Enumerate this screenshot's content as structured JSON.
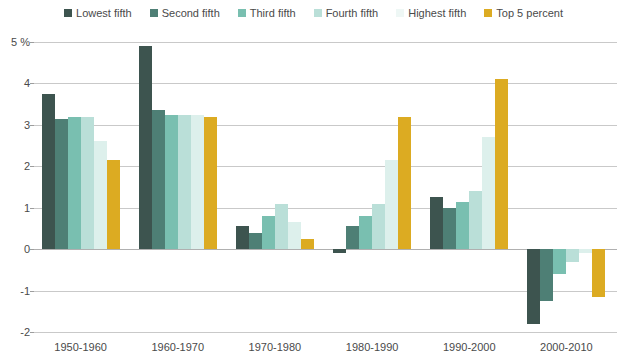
{
  "chart_data": {
    "type": "bar",
    "title": "",
    "subtitle": "",
    "xlabel": "",
    "ylabel": "",
    "ylim": [
      -2,
      5
    ],
    "yticks": [
      -2,
      -1,
      0,
      1,
      2,
      3,
      4,
      5
    ],
    "ytick_labels": [
      "-2",
      "-1",
      "0",
      "1",
      "2",
      "3",
      "4",
      "5 %"
    ],
    "grid": true,
    "legend_position": "top",
    "categories": [
      "1950-1960",
      "1960-1970",
      "1970-1980",
      "1980-1990",
      "1990-2000",
      "2000-2010"
    ],
    "series": [
      {
        "name": "Lowest fifth",
        "color": "#3d544f",
        "values": [
          3.75,
          4.9,
          0.55,
          -0.1,
          1.25,
          -1.8
        ]
      },
      {
        "name": "Second fifth",
        "color": "#4e7f75",
        "values": [
          3.15,
          3.35,
          0.38,
          0.55,
          1.0,
          -1.25
        ]
      },
      {
        "name": "Third fifth",
        "color": "#79bfb0",
        "values": [
          3.2,
          3.25,
          0.8,
          0.8,
          1.15,
          -0.6
        ]
      },
      {
        "name": "Fourth fifth",
        "color": "#badfd8",
        "values": [
          3.2,
          3.25,
          1.1,
          1.1,
          1.4,
          -0.3
        ]
      },
      {
        "name": "Highest fifth",
        "color": "#ddf0ec",
        "values": [
          2.6,
          3.25,
          0.65,
          2.15,
          2.7,
          -0.1
        ]
      },
      {
        "name": "Top 5 percent",
        "color": "#dcab22",
        "values": [
          2.15,
          3.2,
          0.25,
          3.2,
          4.1,
          -1.15
        ]
      }
    ]
  },
  "legend": {
    "items": [
      {
        "label": "Lowest fifth",
        "color": "#3d544f"
      },
      {
        "label": "Second fifth",
        "color": "#4e7f75"
      },
      {
        "label": "Third fifth",
        "color": "#79bfb0"
      },
      {
        "label": "Fourth fifth",
        "color": "#badfd8"
      },
      {
        "label": "Highest fifth",
        "color": "#eef7f5"
      },
      {
        "label": "Top 5 percent",
        "color": "#dcab22"
      }
    ]
  }
}
